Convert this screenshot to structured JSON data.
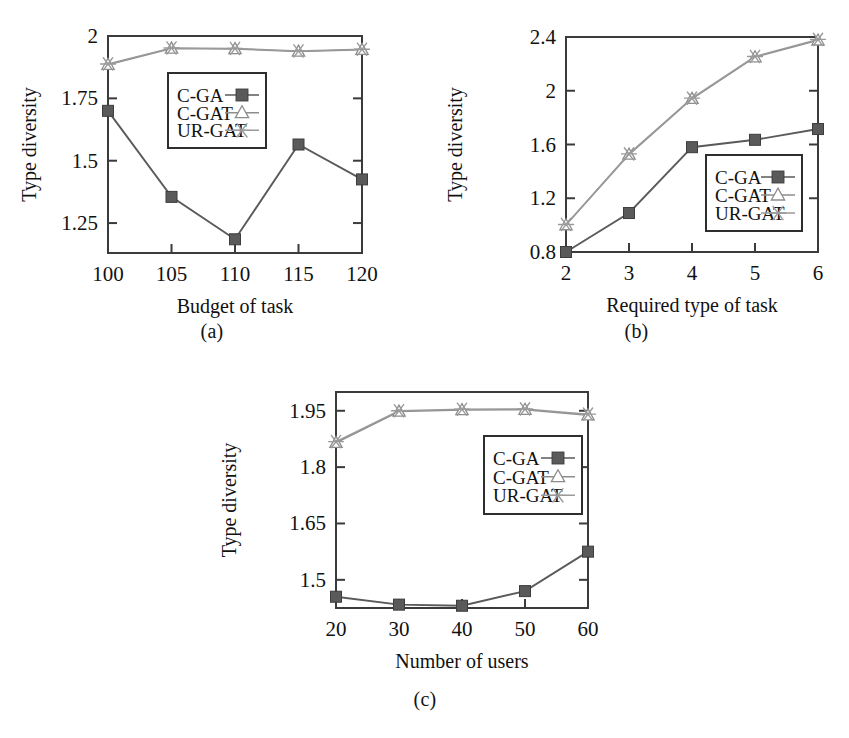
{
  "figure": {
    "panels": [
      {
        "id": "a",
        "caption": "(a)",
        "xlabel": "Budget of task",
        "ylabel": "Type diversity"
      },
      {
        "id": "b",
        "caption": "(b)",
        "xlabel": "Required type of task",
        "ylabel": "Type diversity"
      },
      {
        "id": "c",
        "caption": "(c)",
        "xlabel": "Number of users",
        "ylabel": "Type diversity"
      }
    ],
    "legend_labels": [
      "C-GA",
      "C-GAT",
      "UR-GAT"
    ],
    "colors": {
      "c_ga": "#5a5a5a",
      "c_gat": "#8d8d8d",
      "ur_gat": "#9a9a9a",
      "axis": "#3b3b3b",
      "text": "#111111"
    }
  },
  "chart_data": [
    {
      "type": "line",
      "id": "a",
      "title": "(a)",
      "xlabel": "Budget of task",
      "ylabel": "Type diversity",
      "categories": [
        100,
        105,
        110,
        115,
        120
      ],
      "xtick_labels": [
        "100",
        "105",
        "110",
        "115",
        "120"
      ],
      "ytick_labels": [
        "1.25",
        "1.5",
        "1.75",
        "2"
      ],
      "yticks": [
        1.25,
        1.5,
        1.75,
        2
      ],
      "xlim": [
        100,
        120
      ],
      "ylim": [
        1.13,
        2.0
      ],
      "grid": false,
      "legend_position": "upper-center",
      "series": [
        {
          "name": "C-GA",
          "marker": "filled-square",
          "values": [
            1.7,
            1.355,
            1.185,
            1.565,
            1.425
          ]
        },
        {
          "name": "C-GAT",
          "marker": "open-triangle",
          "values": [
            1.885,
            1.95,
            1.948,
            1.938,
            1.945
          ]
        },
        {
          "name": "UR-GAT",
          "marker": "asterisk",
          "values": [
            1.888,
            1.952,
            1.95,
            1.94,
            1.947
          ]
        }
      ]
    },
    {
      "type": "line",
      "id": "b",
      "title": "(b)",
      "xlabel": "Required type of task",
      "ylabel": "Type diversity",
      "categories": [
        2,
        3,
        4,
        5,
        6
      ],
      "xtick_labels": [
        "2",
        "3",
        "4",
        "5",
        "6"
      ],
      "ytick_labels": [
        "0.8",
        "1.2",
        "1.6",
        "2",
        "2.4"
      ],
      "yticks": [
        0.8,
        1.2,
        1.6,
        2.0,
        2.4
      ],
      "xlim": [
        2,
        6
      ],
      "ylim": [
        0.8,
        2.4
      ],
      "grid": false,
      "legend_position": "lower-right",
      "series": [
        {
          "name": "C-GA",
          "marker": "filled-square",
          "values": [
            0.8,
            1.09,
            1.58,
            1.635,
            1.715
          ]
        },
        {
          "name": "C-GAT",
          "marker": "open-triangle",
          "values": [
            1.0,
            1.525,
            1.94,
            2.25,
            2.375
          ]
        },
        {
          "name": "UR-GAT",
          "marker": "asterisk",
          "values": [
            1.005,
            1.53,
            1.945,
            2.255,
            2.382
          ]
        }
      ]
    },
    {
      "type": "line",
      "id": "c",
      "title": "(c)",
      "xlabel": "Number of users",
      "ylabel": "Type diversity",
      "categories": [
        20,
        30,
        40,
        50,
        60
      ],
      "xtick_labels": [
        "20",
        "30",
        "40",
        "50",
        "60"
      ],
      "ytick_labels": [
        "1.5",
        "1.65",
        "1.8",
        "1.95"
      ],
      "yticks": [
        1.5,
        1.65,
        1.8,
        1.95
      ],
      "xlim": [
        20,
        60
      ],
      "ylim": [
        1.425,
        2.0
      ],
      "grid": false,
      "legend_position": "upper-right",
      "series": [
        {
          "name": "C-GA",
          "marker": "filled-square",
          "values": [
            1.455,
            1.434,
            1.431,
            1.47,
            1.575
          ]
        },
        {
          "name": "C-GAT",
          "marker": "open-triangle",
          "values": [
            1.865,
            1.948,
            1.952,
            1.953,
            1.938
          ]
        },
        {
          "name": "UR-GAT",
          "marker": "asterisk",
          "values": [
            1.868,
            1.95,
            1.954,
            1.955,
            1.941
          ]
        }
      ]
    }
  ]
}
